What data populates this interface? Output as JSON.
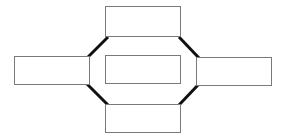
{
  "diagram": {
    "title": "",
    "type": "hub-and-spoke-block-diagram",
    "background_color": "#ffffff",
    "node_border_color": "#7a7a7a",
    "node_fill_color": "#ffffff",
    "connector_color": "#111111",
    "connector_width": 3,
    "node_border_width": 1,
    "canvas": {
      "width": 289,
      "height": 139
    },
    "nodes": [
      {
        "id": "top",
        "name": "top-box",
        "label": "",
        "shape": "rectangle",
        "x": 105,
        "y": 6,
        "width": 76,
        "height": 31
      },
      {
        "id": "left",
        "name": "left-box",
        "label": "",
        "shape": "rectangle",
        "x": 14,
        "y": 56,
        "width": 76,
        "height": 29
      },
      {
        "id": "center",
        "name": "center-box",
        "label": "",
        "shape": "rectangle",
        "x": 105,
        "y": 55,
        "width": 76,
        "height": 29
      },
      {
        "id": "right",
        "name": "right-box",
        "label": "",
        "shape": "rectangle",
        "x": 196,
        "y": 57,
        "width": 76,
        "height": 29
      },
      {
        "id": "bottom",
        "name": "bottom-box",
        "label": "",
        "shape": "rectangle",
        "x": 105,
        "y": 104,
        "width": 76,
        "height": 29
      }
    ],
    "connectors": [
      {
        "id": "left-to-top",
        "name": "connector-left-top",
        "from": "left",
        "to": "top",
        "label": "",
        "x1": 87,
        "y1": 58,
        "x2": 108,
        "y2": 37
      },
      {
        "id": "top-to-right",
        "name": "connector-top-right",
        "from": "top",
        "to": "right",
        "label": "",
        "x1": 179,
        "y1": 37,
        "x2": 199,
        "y2": 58
      },
      {
        "id": "left-to-bottom",
        "name": "connector-left-bottom",
        "from": "left",
        "to": "bottom",
        "label": "",
        "x1": 87,
        "y1": 84,
        "x2": 108,
        "y2": 105
      },
      {
        "id": "bottom-to-right",
        "name": "connector-bottom-right",
        "from": "bottom",
        "to": "right",
        "label": "",
        "x1": 179,
        "y1": 105,
        "x2": 198,
        "y2": 85
      }
    ]
  }
}
